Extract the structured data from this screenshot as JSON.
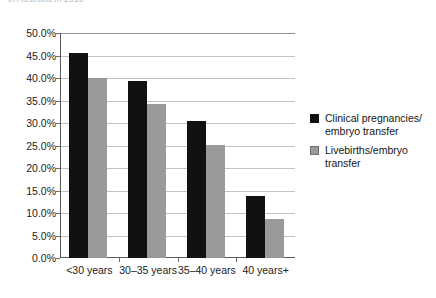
{
  "caption_fragment": "in Australia in 2010",
  "chart_data": {
    "type": "bar",
    "title": "",
    "xlabel": "",
    "ylabel": "",
    "categories": [
      "<30 years",
      "30–35 years",
      "35–40 years",
      "40 years+"
    ],
    "series": [
      {
        "name": "Clinical pregnancies/ embryo transfer",
        "color": "#111111",
        "values": [
          45.5,
          39.3,
          30.5,
          13.8
        ]
      },
      {
        "name": "Livebirths/embryo transfer",
        "color": "#9a9a9a",
        "values": [
          40.0,
          34.3,
          25.1,
          8.7
        ]
      }
    ],
    "ylim": [
      0,
      50
    ],
    "ytick_values": [
      0,
      5,
      10,
      15,
      20,
      25,
      30,
      35,
      40,
      45,
      50
    ],
    "ytick_labels": [
      "0.0%",
      "5.0%",
      "10.0%",
      "15.0%",
      "20.0%",
      "25.0%",
      "30.0%",
      "35.0%",
      "40.0%",
      "45.0%",
      "50.0%"
    ],
    "grid": true,
    "legend_position": "right",
    "legend": [
      {
        "label_line1": "Clinical pregnancies/",
        "label_line2": "embryo transfer",
        "color": "#111111"
      },
      {
        "label_line1": "Livebirths/embryo",
        "label_line2": "transfer",
        "color": "#9a9a9a"
      }
    ]
  }
}
